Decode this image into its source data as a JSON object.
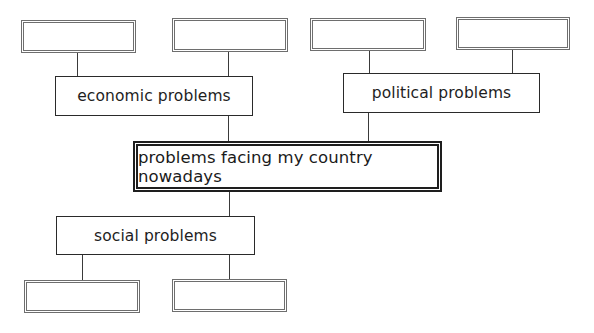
{
  "diagram": {
    "type": "mind-map",
    "central_topic": {
      "label": "problems facing my country nowadays"
    },
    "branches": [
      {
        "label": "economic problems",
        "position": "top-left",
        "sub_items": [
          "",
          ""
        ]
      },
      {
        "label": "political problems",
        "position": "top-right",
        "sub_items": [
          "",
          ""
        ]
      },
      {
        "label": "social problems",
        "position": "bottom-left",
        "sub_items": [
          "",
          ""
        ]
      }
    ],
    "colors": {
      "line": "#3a3a3a",
      "blank_box_border": "#6e6e6e",
      "topic_box_border": "#2a2a2a",
      "central_box_border": "#1e1e1e",
      "text": "#1e1e1e",
      "background": "#ffffff"
    }
  }
}
